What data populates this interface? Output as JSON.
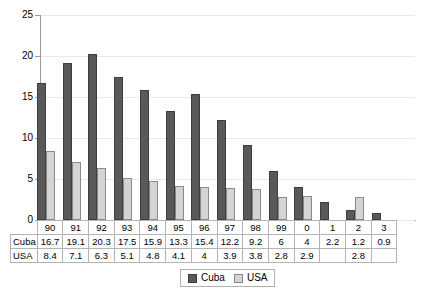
{
  "chart_data": {
    "type": "bar",
    "title": "",
    "xlabel": "",
    "ylabel": "",
    "ylim": [
      0,
      25
    ],
    "yticks": [
      0,
      5,
      10,
      15,
      20,
      25
    ],
    "grid": true,
    "legend_position": "bottom-center",
    "categories": [
      "90",
      "91",
      "92",
      "93",
      "94",
      "95",
      "96",
      "97",
      "98",
      "99",
      "0",
      "1",
      "2",
      "3"
    ],
    "series": [
      {
        "name": "Cuba",
        "color": "#595959",
        "values": [
          16.7,
          19.1,
          20.3,
          17.5,
          15.9,
          13.3,
          15.4,
          12.2,
          9.2,
          6,
          4,
          2.2,
          1.2,
          0.9
        ],
        "labels": [
          "16.7",
          "19.1",
          "20.3",
          "17.5",
          "15.9",
          "13.3",
          "15.4",
          "12.2",
          "9.2",
          "6",
          "4",
          "2.2",
          "1.2",
          "0.9"
        ]
      },
      {
        "name": "USA",
        "color": "#d4d4d4",
        "values": [
          8.4,
          7.1,
          6.3,
          5.1,
          4.8,
          4.1,
          4,
          3.9,
          3.8,
          2.8,
          2.9,
          null,
          2.8,
          null
        ],
        "labels": [
          "8.4",
          "7.1",
          "6.3",
          "5.1",
          "4.8",
          "4.1",
          "4",
          "3.9",
          "3.8",
          "2.8",
          "2.9",
          "",
          "2.8",
          ""
        ]
      }
    ]
  },
  "table": {
    "header_row": [
      "90",
      "91",
      "92",
      "93",
      "94",
      "95",
      "96",
      "97",
      "98",
      "99",
      "0",
      "1",
      "2",
      "3"
    ],
    "rows": [
      {
        "label": "Cuba",
        "values": [
          "16.7",
          "19.1",
          "20.3",
          "17.5",
          "15.9",
          "13.3",
          "15.4",
          "12.2",
          "9.2",
          "6",
          "4",
          "2.2",
          "1.2",
          "0.9"
        ]
      },
      {
        "label": "USA",
        "values": [
          "8.4",
          "7.1",
          "6.3",
          "5.1",
          "4.8",
          "4.1",
          "4",
          "3.9",
          "3.8",
          "2.8",
          "2.9",
          "",
          "2.8",
          ""
        ]
      }
    ]
  },
  "legend": {
    "entries": [
      {
        "label": "Cuba",
        "color": "#595959"
      },
      {
        "label": "USA",
        "color": "#d4d4d4"
      }
    ]
  },
  "axis": {
    "y_tick_labels": [
      "0",
      "5",
      "10",
      "15",
      "20",
      "25"
    ]
  }
}
